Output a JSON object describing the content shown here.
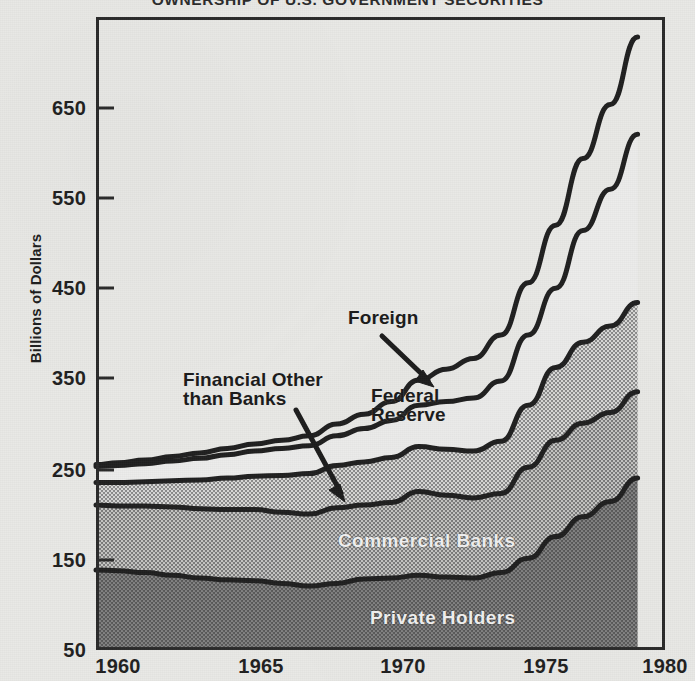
{
  "chart_data": {
    "type": "area",
    "title": "OWNERSHIP OF U.S. GOVERNMENT SECURITIES",
    "subtitle": "",
    "xlabel": "",
    "ylabel": "Billions of Dollars",
    "stacked": true,
    "grid": false,
    "legend_position": "inline-annotations",
    "xlim": [
      1959.2,
      1980
    ],
    "ylim": [
      50,
      705
    ],
    "xticks": [
      1960,
      1965,
      1970,
      1975,
      1980
    ],
    "xtick_labels": [
      "1960",
      "1965",
      "1970",
      "1975",
      "1980"
    ],
    "yticks": [
      50,
      150,
      250,
      350,
      450,
      550,
      650
    ],
    "ytick_labels": [
      "50",
      "150",
      "250",
      "350",
      "450",
      "550",
      "650"
    ],
    "x": [
      1959.2,
      1960,
      1961,
      1962,
      1963,
      1964,
      1965,
      1966,
      1967,
      1968,
      1969,
      1970,
      1971,
      1972,
      1973,
      1974,
      1975,
      1976,
      1977,
      1978,
      1979
    ],
    "series": [
      {
        "name": "Private Holders",
        "fill": "dark-halftone",
        "cumulative_top": [
          139,
          138,
          136,
          133,
          130,
          128,
          127,
          124,
          121,
          124,
          129,
          130,
          133,
          131,
          130,
          136,
          152,
          176,
          198,
          215,
          241
        ]
      },
      {
        "name": "Commercial Banks",
        "fill": "mid-halftone",
        "cumulative_top": [
          211,
          210,
          210,
          209,
          207,
          206,
          206,
          203,
          201,
          208,
          211,
          214,
          226,
          222,
          219,
          224,
          253,
          283,
          302,
          314,
          337
        ]
      },
      {
        "name": "Federal Reserve",
        "fill": "light-halftone",
        "cumulative_top": [
          236,
          236,
          237,
          238,
          239,
          241,
          243,
          244,
          246,
          255,
          259,
          264,
          276,
          273,
          271,
          282,
          322,
          364,
          392,
          410,
          436
        ]
      },
      {
        "name": "Foreign",
        "fill": "white",
        "cumulative_top": [
          254,
          255,
          257,
          260,
          263,
          267,
          271,
          274,
          277,
          288,
          296,
          305,
          322,
          326,
          330,
          349,
          400,
          452,
          516,
          562,
          623
        ]
      },
      {
        "name": "Total",
        "fill": "none",
        "cumulative_top": [
          256,
          258,
          261,
          265,
          269,
          274,
          279,
          283,
          288,
          301,
          312,
          326,
          350,
          362,
          374,
          400,
          458,
          522,
          596,
          656,
          731
        ]
      }
    ],
    "annotations": [
      {
        "text": "Foreign",
        "points_to": "Foreign",
        "style": "dark"
      },
      {
        "text": "Financial Other\nthan Banks",
        "points_to": "Commercial Banks",
        "style": "dark"
      },
      {
        "text": "Federal\nReserve",
        "points_to": "Federal Reserve",
        "style": "dark"
      },
      {
        "text": "Commercial Banks",
        "points_to": "Commercial Banks",
        "style": "light"
      },
      {
        "text": "Private Holders",
        "points_to": "Private Holders",
        "style": "light"
      }
    ]
  },
  "labels": {
    "title": "OWNERSHIP OF U.S. GOVERNMENT SECURITIES",
    "y_axis_title": "Billions of Dollars",
    "foreign": "Foreign",
    "financial_other_line1": "Financial Other",
    "financial_other_line2": "than Banks",
    "federal_reserve_line1": "Federal",
    "federal_reserve_line2": "Reserve",
    "commercial_banks": "Commercial Banks",
    "private_holders": "Private Holders",
    "y_ticks": [
      "650",
      "550",
      "450",
      "350",
      "250",
      "150",
      "50"
    ],
    "x_ticks": [
      "1960",
      "1965",
      "1970",
      "1975",
      "1980"
    ]
  },
  "colors": {
    "background": "#e9e9e6",
    "ink": "#2a2a2a",
    "band_private": "#6d6d6d",
    "band_commercial": "#9b9b9b",
    "band_federal": "#bdbdbd",
    "band_foreign": "#efefed"
  }
}
